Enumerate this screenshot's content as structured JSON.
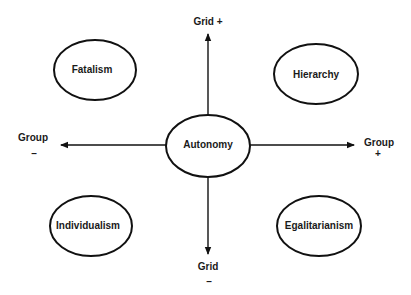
{
  "diagram": {
    "colors": {
      "stroke": "#111111",
      "text": "#1a1a1a",
      "background": "#ffffff"
    },
    "center": {
      "label": "Autonomy"
    },
    "quadrants": {
      "top_left": {
        "label": "Fatalism"
      },
      "top_right": {
        "label": "Hierarchy"
      },
      "bottom_left": {
        "label": "Individualism"
      },
      "bottom_right": {
        "label": "Egalitarianism"
      }
    },
    "axes": {
      "up": {
        "label": "Grid +"
      },
      "down": {
        "label": "Grid",
        "sign": "–"
      },
      "left": {
        "label": "Group",
        "sign": "–"
      },
      "right": {
        "label": "Group",
        "sign": "+"
      }
    }
  }
}
